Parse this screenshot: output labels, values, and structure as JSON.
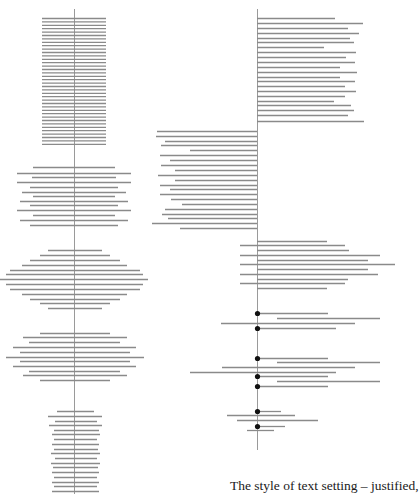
{
  "caption": "The style of text setting – justified,",
  "colors": {
    "line": "#8a8a8a",
    "axis": "#9a9a9a",
    "dot": "#111111"
  },
  "axes": [
    {
      "name": "left-axis",
      "x": 74.5,
      "y1": 9,
      "y2": 494
    },
    {
      "name": "right-axis",
      "x": 257.5,
      "y1": 9,
      "y2": 450
    }
  ],
  "blocks": [
    {
      "name": "justified-block",
      "lines": [
        [
          42,
          106,
          18
        ],
        [
          42,
          106,
          21.4
        ],
        [
          42,
          106,
          24.8
        ],
        [
          42,
          106,
          28.2
        ],
        [
          42,
          106,
          31.6
        ],
        [
          42,
          106,
          35
        ],
        [
          42,
          106,
          38.4
        ],
        [
          42,
          106,
          41.8
        ],
        [
          42,
          106,
          45.2
        ],
        [
          42,
          106,
          48.6
        ],
        [
          42,
          106,
          52
        ],
        [
          42,
          106,
          55.4
        ],
        [
          42,
          106,
          58.8
        ],
        [
          42,
          106,
          62.2
        ],
        [
          42,
          106,
          65.6
        ],
        [
          42,
          106,
          69
        ],
        [
          42,
          106,
          72.4
        ],
        [
          42,
          106,
          75.8
        ],
        [
          42,
          106,
          79.2
        ],
        [
          42,
          106,
          82.6
        ],
        [
          42,
          106,
          86
        ],
        [
          42,
          106,
          89.4
        ],
        [
          42,
          106,
          92.8
        ],
        [
          42,
          106,
          96.2
        ],
        [
          42,
          106,
          99.6
        ],
        [
          42,
          106,
          103
        ],
        [
          42,
          106,
          106.4
        ],
        [
          42,
          106,
          109.8
        ],
        [
          42,
          106,
          113.2
        ],
        [
          42,
          106,
          116.6
        ],
        [
          42,
          106,
          120
        ],
        [
          42,
          106,
          123.4
        ],
        [
          42,
          106,
          126.8
        ],
        [
          42,
          106,
          130.2
        ],
        [
          42,
          106,
          133.6
        ],
        [
          42,
          106,
          137
        ],
        [
          42,
          106,
          140.4
        ],
        [
          42,
          106,
          143.8
        ]
      ]
    },
    {
      "name": "centered-block",
      "lines": [
        [
          33,
          115,
          167
        ],
        [
          17,
          131,
          173
        ],
        [
          32,
          116,
          177
        ],
        [
          17,
          131,
          182
        ],
        [
          30,
          118,
          187
        ],
        [
          22,
          126,
          192
        ],
        [
          33,
          115,
          196
        ],
        [
          20,
          128,
          201
        ],
        [
          30,
          118,
          205
        ],
        [
          17,
          131,
          210
        ],
        [
          33,
          115,
          215
        ],
        [
          20,
          128,
          220
        ],
        [
          30,
          118,
          225
        ]
      ]
    },
    {
      "name": "diamond-block",
      "lines": [
        [
          48,
          102,
          250
        ],
        [
          40,
          110,
          255
        ],
        [
          30,
          120,
          260
        ],
        [
          22,
          127,
          265
        ],
        [
          10,
          140,
          270
        ],
        [
          6,
          143,
          274
        ],
        [
          0,
          148,
          279
        ],
        [
          6,
          143,
          284
        ],
        [
          10,
          140,
          289
        ],
        [
          22,
          127,
          294
        ],
        [
          30,
          120,
          299
        ],
        [
          40,
          110,
          303
        ],
        [
          48,
          102,
          308
        ]
      ]
    },
    {
      "name": "oval-block",
      "lines": [
        [
          40,
          110,
          333
        ],
        [
          23,
          127,
          337
        ],
        [
          29,
          120,
          342
        ],
        [
          13,
          136,
          347
        ],
        [
          20,
          130,
          352
        ],
        [
          6,
          144,
          357
        ],
        [
          20,
          130,
          361
        ],
        [
          13,
          136,
          366
        ],
        [
          29,
          120,
          371
        ],
        [
          23,
          127,
          375
        ],
        [
          40,
          110,
          380
        ]
      ]
    },
    {
      "name": "narrow-ragged-block",
      "lines": [
        [
          57,
          94,
          411
        ],
        [
          48,
          102,
          416
        ],
        [
          55,
          97,
          421
        ],
        [
          49,
          102,
          425
        ],
        [
          54,
          99,
          430
        ],
        [
          52,
          100,
          434
        ],
        [
          54,
          97,
          439
        ],
        [
          52,
          99,
          444
        ],
        [
          54,
          98,
          449
        ],
        [
          51,
          100,
          453
        ],
        [
          55,
          97,
          458
        ],
        [
          51,
          100,
          463
        ],
        [
          53,
          98,
          467
        ],
        [
          52,
          99,
          472
        ],
        [
          54,
          97,
          477
        ],
        [
          52,
          99,
          482
        ],
        [
          54,
          97,
          486
        ],
        [
          52,
          99,
          491
        ]
      ]
    },
    {
      "name": "flush-left-block",
      "lines": [
        [
          257,
          335,
          18
        ],
        [
          257,
          363,
          23
        ],
        [
          257,
          348,
          28
        ],
        [
          257,
          359,
          33
        ],
        [
          257,
          350,
          38
        ],
        [
          257,
          354,
          42
        ],
        [
          257,
          324,
          47
        ],
        [
          257,
          356,
          52
        ],
        [
          257,
          346,
          57
        ],
        [
          257,
          355,
          62
        ],
        [
          257,
          340,
          67
        ],
        [
          257,
          357,
          72
        ],
        [
          257,
          340,
          77
        ],
        [
          257,
          355,
          81
        ],
        [
          257,
          345,
          86
        ],
        [
          257,
          356,
          91
        ],
        [
          257,
          345,
          96
        ],
        [
          257,
          334,
          101
        ],
        [
          257,
          351,
          105
        ],
        [
          257,
          354,
          110
        ],
        [
          257,
          348,
          115
        ],
        [
          257,
          364,
          121
        ]
      ]
    },
    {
      "name": "flush-right-block",
      "lines": [
        [
          157,
          257,
          131
        ],
        [
          156,
          257,
          136
        ],
        [
          165,
          257,
          141
        ],
        [
          161,
          257,
          145
        ],
        [
          190,
          257,
          150
        ],
        [
          160,
          257,
          155
        ],
        [
          170,
          257,
          160
        ],
        [
          161,
          257,
          165
        ],
        [
          175,
          257,
          170
        ],
        [
          158,
          257,
          175
        ],
        [
          175,
          257,
          180
        ],
        [
          160,
          257,
          185
        ],
        [
          170,
          257,
          189
        ],
        [
          160,
          257,
          194
        ],
        [
          171,
          257,
          199
        ],
        [
          182,
          257,
          204
        ],
        [
          165,
          257,
          209
        ],
        [
          162,
          257,
          214
        ],
        [
          168,
          257,
          218
        ],
        [
          152,
          257,
          223
        ],
        [
          180,
          257,
          228
        ]
      ]
    },
    {
      "name": "asymmetric-block",
      "lines": [
        [
          257,
          327,
          241
        ],
        [
          240,
          345,
          245
        ],
        [
          257,
          349,
          250
        ],
        [
          240,
          380,
          255
        ],
        [
          257,
          368,
          260
        ],
        [
          240,
          395,
          264
        ],
        [
          257,
          368,
          269
        ],
        [
          240,
          378,
          274
        ],
        [
          257,
          348,
          279
        ],
        [
          240,
          345,
          283
        ],
        [
          257,
          327,
          288
        ]
      ]
    },
    {
      "name": "dotted-block",
      "lines": [
        [
          257,
          328,
          313
        ],
        [
          277,
          380,
          318
        ],
        [
          221,
          355,
          323
        ],
        [
          257,
          336,
          328
        ],
        [
          257,
          328,
          358
        ],
        [
          277,
          380,
          362
        ],
        [
          222,
          355,
          367
        ],
        [
          190,
          336,
          372
        ],
        [
          257,
          328,
          376
        ],
        [
          277,
          380,
          381
        ],
        [
          257,
          328,
          386
        ],
        [
          257,
          281,
          411
        ],
        [
          227,
          295,
          415
        ],
        [
          237,
          318,
          420
        ],
        [
          257,
          285,
          426
        ],
        [
          247,
          274,
          430
        ]
      ],
      "dots": [
        [
          257.5,
          313
        ],
        [
          257.5,
          328
        ],
        [
          257.5,
          358
        ],
        [
          257.5,
          376
        ],
        [
          257.5,
          386
        ],
        [
          257.5,
          411
        ],
        [
          257.5,
          426
        ]
      ]
    }
  ]
}
